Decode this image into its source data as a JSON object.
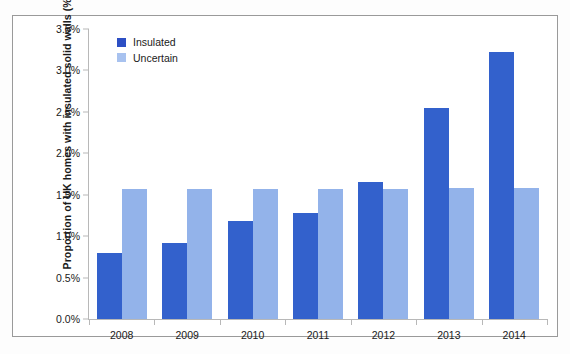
{
  "chart_data": {
    "type": "bar",
    "title": "",
    "xlabel": "",
    "ylabel": "Proportion of UK homes with insulated solid walls (%)",
    "categories": [
      "2008",
      "2009",
      "2010",
      "2011",
      "2012",
      "2013",
      "2014"
    ],
    "series": [
      {
        "name": "Insulated",
        "color": "#3361cc",
        "values": [
          0.8,
          0.92,
          1.18,
          1.28,
          1.65,
          2.55,
          3.22
        ]
      },
      {
        "name": "Uncertain",
        "color": "#93b3ea",
        "values": [
          1.57,
          1.57,
          1.57,
          1.57,
          1.57,
          1.58,
          1.58
        ]
      }
    ],
    "ylim": [
      0,
      3.5
    ],
    "ytick_values": [
      0,
      0.5,
      1.0,
      1.5,
      2.0,
      2.5,
      3.0,
      3.5
    ],
    "ytick_labels": [
      "0.0%",
      "0.5%",
      "1.0%",
      "1.5%",
      "2.0%",
      "2.5%",
      "3.0%",
      "3.5%"
    ],
    "grid": false,
    "legend_position": "top-left",
    "value_suffix": "%"
  },
  "legend": {
    "items": [
      {
        "label": "Insulated",
        "swatch": "legend-swatch-insulated"
      },
      {
        "label": "Uncertain",
        "swatch": "legend-swatch-uncertain"
      }
    ]
  },
  "colors": {
    "insulated": "#3361cc",
    "uncertain": "#93b3ea",
    "axis": "#b8b8b8",
    "frame": "#9a9a9a",
    "text": "#1a1a1a"
  }
}
